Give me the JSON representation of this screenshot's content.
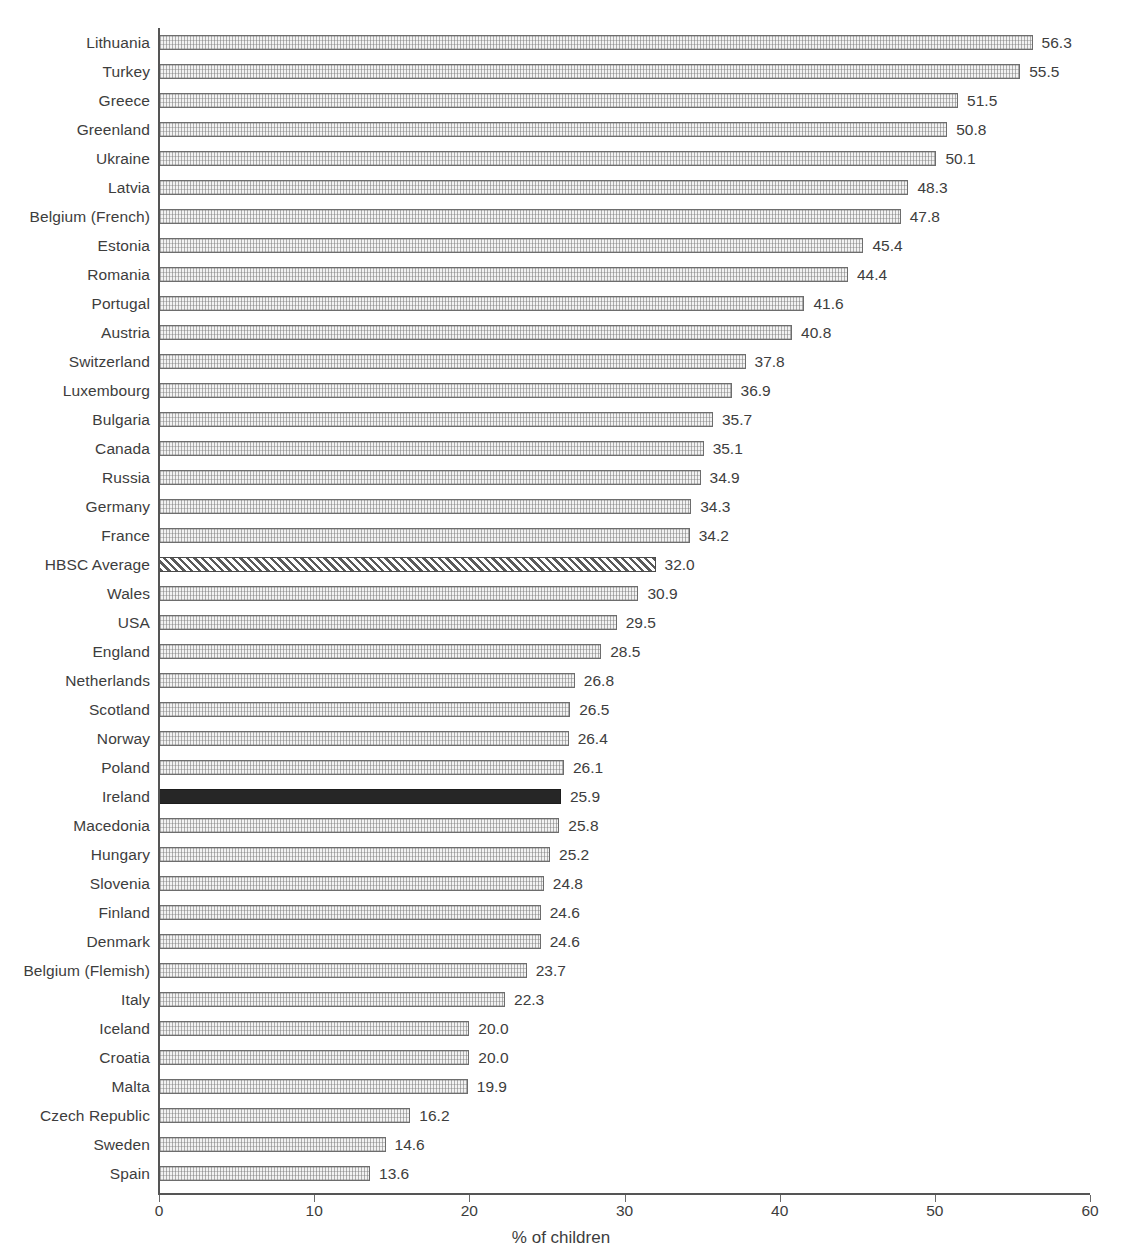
{
  "chart_data": {
    "type": "bar",
    "orientation": "horizontal",
    "title": "",
    "xlabel": "% of children",
    "ylabel": "",
    "xlim": [
      0,
      60
    ],
    "xticks": [
      0,
      10,
      20,
      30,
      40,
      50,
      60
    ],
    "xtick_labels": [
      "0",
      "10",
      "20",
      "30",
      "40",
      "50",
      "60"
    ],
    "grid": false,
    "legend": null,
    "value_label_format": "one-decimal",
    "categories": [
      "Lithuania",
      "Turkey",
      "Greece",
      "Greenland",
      "Ukraine",
      "Latvia",
      "Belgium (French)",
      "Estonia",
      "Romania",
      "Portugal",
      "Austria",
      "Switzerland",
      "Luxembourg",
      "Bulgaria",
      "Canada",
      "Russia",
      "Germany",
      "France",
      "HBSC Average",
      "Wales",
      "USA",
      "England",
      "Netherlands",
      "Scotland",
      "Norway",
      "Poland",
      "Ireland",
      "Macedonia",
      "Hungary",
      "Slovenia",
      "Finland",
      "Denmark",
      "Belgium (Flemish)",
      "Italy",
      "Iceland",
      "Croatia",
      "Malta",
      "Czech Republic",
      "Sweden",
      "Spain"
    ],
    "values": [
      56.3,
      55.5,
      51.5,
      50.8,
      50.1,
      48.3,
      47.8,
      45.4,
      44.4,
      41.6,
      40.8,
      37.8,
      36.9,
      35.7,
      35.1,
      34.9,
      34.3,
      34.2,
      32.0,
      30.9,
      29.5,
      28.5,
      26.8,
      26.5,
      26.4,
      26.1,
      25.9,
      25.8,
      25.2,
      24.8,
      24.6,
      24.6,
      23.7,
      22.3,
      20.0,
      20.0,
      19.9,
      16.2,
      14.6,
      13.6
    ],
    "value_labels": [
      "56.3",
      "55.5",
      "51.5",
      "50.8",
      "50.1",
      "48.3",
      "47.8",
      "45.4",
      "44.4",
      "41.6",
      "40.8",
      "37.8",
      "36.9",
      "35.7",
      "35.1",
      "34.9",
      "34.3",
      "34.2",
      "32.0",
      "30.9",
      "29.5",
      "28.5",
      "26.8",
      "26.5",
      "26.4",
      "26.1",
      "25.9",
      "25.8",
      "25.2",
      "24.8",
      "24.6",
      "24.6",
      "23.7",
      "22.3",
      "20.0",
      "20.0",
      "19.9",
      "16.2",
      "14.6",
      "13.6"
    ],
    "bar_styles": [
      "grid",
      "grid",
      "grid",
      "grid",
      "grid",
      "grid",
      "grid",
      "grid",
      "grid",
      "grid",
      "grid",
      "grid",
      "grid",
      "grid",
      "grid",
      "grid",
      "grid",
      "grid",
      "hatch",
      "grid",
      "grid",
      "grid",
      "grid",
      "grid",
      "grid",
      "grid",
      "solid",
      "grid",
      "grid",
      "grid",
      "grid",
      "grid",
      "grid",
      "grid",
      "grid",
      "grid",
      "grid",
      "grid",
      "grid",
      "grid"
    ],
    "highlight_category": "Ireland",
    "reference_category": "HBSC Average",
    "colors": {
      "bar_fill": "#f2f2f2",
      "bar_edge": "#6d6d6d",
      "highlight_fill": "#262626",
      "hatch_edge": "#4a4a4a",
      "axis": "#555555",
      "text": "#3d3d3d",
      "background": "#ffffff"
    }
  }
}
